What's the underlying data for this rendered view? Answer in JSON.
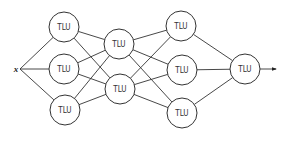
{
  "diagram": {
    "input": {
      "label": "x",
      "x": 16,
      "y": 69
    },
    "node_label": "TLU",
    "node_radius": 15,
    "layers": [
      [
        {
          "id": "a1",
          "x": 64,
          "y": 27
        },
        {
          "id": "a2",
          "x": 64,
          "y": 69
        },
        {
          "id": "a3",
          "x": 65,
          "y": 110
        }
      ],
      [
        {
          "id": "b1",
          "x": 119,
          "y": 44
        },
        {
          "id": "b2",
          "x": 120,
          "y": 89
        }
      ],
      [
        {
          "id": "c1",
          "x": 181,
          "y": 26
        },
        {
          "id": "c2",
          "x": 182,
          "y": 70
        },
        {
          "id": "c3",
          "x": 182,
          "y": 113
        }
      ],
      [
        {
          "id": "d1",
          "x": 245,
          "y": 69
        }
      ]
    ],
    "output_arrow": {
      "x1": 260,
      "y1": 69,
      "x2": 276,
      "y2": 69
    },
    "colors": {
      "stroke": "#333333",
      "background": "#ffffff"
    }
  }
}
